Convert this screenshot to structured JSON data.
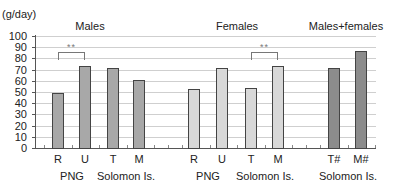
{
  "chart_data": {
    "type": "bar",
    "title": "",
    "ylabel": "(g/day)",
    "xlabel": "",
    "ylim": [
      0,
      100
    ],
    "yticks": [
      0,
      10,
      20,
      30,
      40,
      50,
      60,
      70,
      80,
      90,
      100
    ],
    "grid": true,
    "groups": [
      {
        "title": "Males",
        "color": "#a8a8a8",
        "categories": [
          "R",
          "U",
          "T",
          "M"
        ],
        "values": [
          49,
          73,
          71,
          61
        ],
        "subgroups": [
          {
            "label": "PNG",
            "categories": [
              "R",
              "U"
            ]
          },
          {
            "label": "Solomon Is.",
            "categories": [
              "T",
              "M"
            ]
          }
        ],
        "significance": [
          {
            "between": [
              "R",
              "U"
            ],
            "label": "**"
          }
        ]
      },
      {
        "title": "Females",
        "color": "#d8d8d8",
        "categories": [
          "R",
          "U",
          "T",
          "M"
        ],
        "values": [
          53,
          71,
          54,
          73
        ],
        "subgroups": [
          {
            "label": "PNG",
            "categories": [
              "R",
              "U"
            ]
          },
          {
            "label": "Solomon Is.",
            "categories": [
              "T",
              "M"
            ]
          }
        ],
        "significance": [
          {
            "between": [
              "T",
              "M"
            ],
            "label": "**"
          }
        ]
      },
      {
        "title": "Males+females",
        "color": "#8c8c8c",
        "categories": [
          "T#",
          "M#"
        ],
        "values": [
          71,
          87
        ],
        "subgroups": [
          {
            "label": "Solomon Is.",
            "categories": [
              "T#",
              "M#"
            ]
          }
        ]
      }
    ]
  },
  "labels": {
    "unit": "(g/day)",
    "males": "Males",
    "females": "Females",
    "combined": "Males+females",
    "png": "PNG",
    "solomon": "Solomon Is.",
    "sig": "**"
  }
}
